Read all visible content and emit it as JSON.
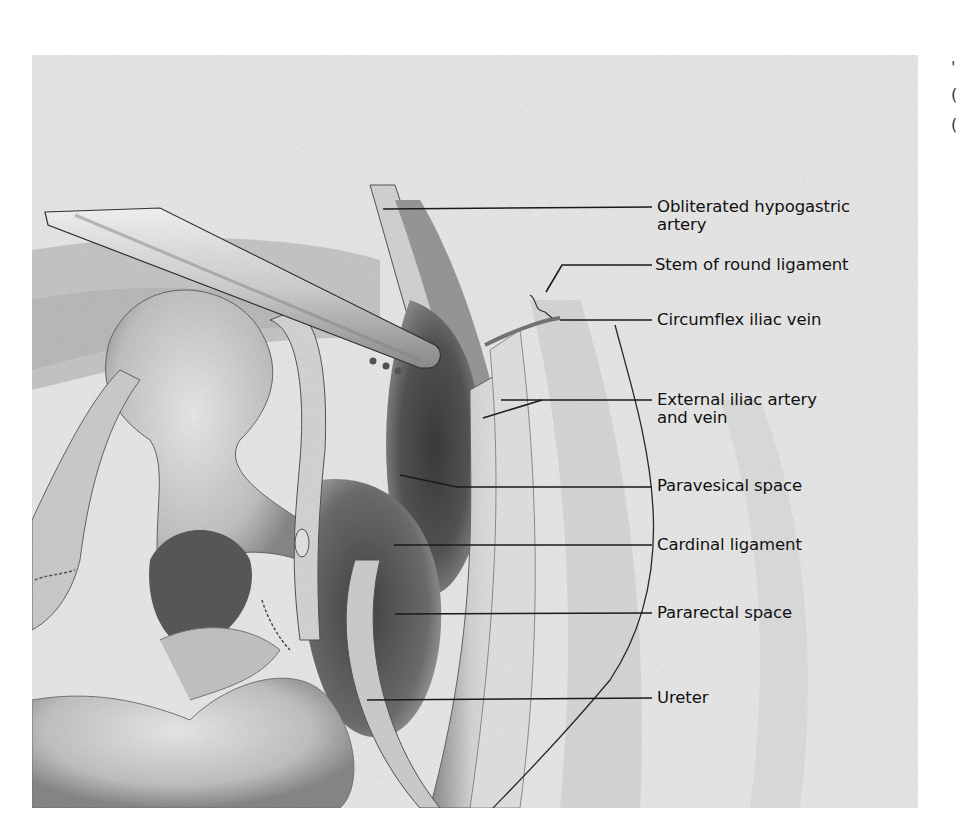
{
  "figure": {
    "colors": {
      "background": "#ffffff",
      "illustration_base": "#e9e9e9",
      "shadow": "#3a3a3a",
      "label_text": "#111111",
      "leader_line": "#1a1a1a"
    },
    "labels": [
      {
        "id": "obliterated-hypogastric-artery",
        "line1": "Obliterated hypogastric",
        "line2": "artery"
      },
      {
        "id": "stem-of-round-ligament",
        "line1": "Stem of round ligament"
      },
      {
        "id": "circumflex-iliac-vein",
        "line1": "Circumflex iliac vein"
      },
      {
        "id": "external-iliac-artery-and-vein",
        "line1": "External iliac artery",
        "line2": "and vein"
      },
      {
        "id": "paravesical-space",
        "line1": "Paravesical space"
      },
      {
        "id": "cardinal-ligament",
        "line1": "Cardinal ligament"
      },
      {
        "id": "pararectal-space",
        "line1": "Pararectal space"
      },
      {
        "id": "ureter",
        "line1": "Ureter"
      }
    ],
    "edge_text": {
      "glyphs": [
        "'",
        "(",
        "("
      ]
    }
  }
}
